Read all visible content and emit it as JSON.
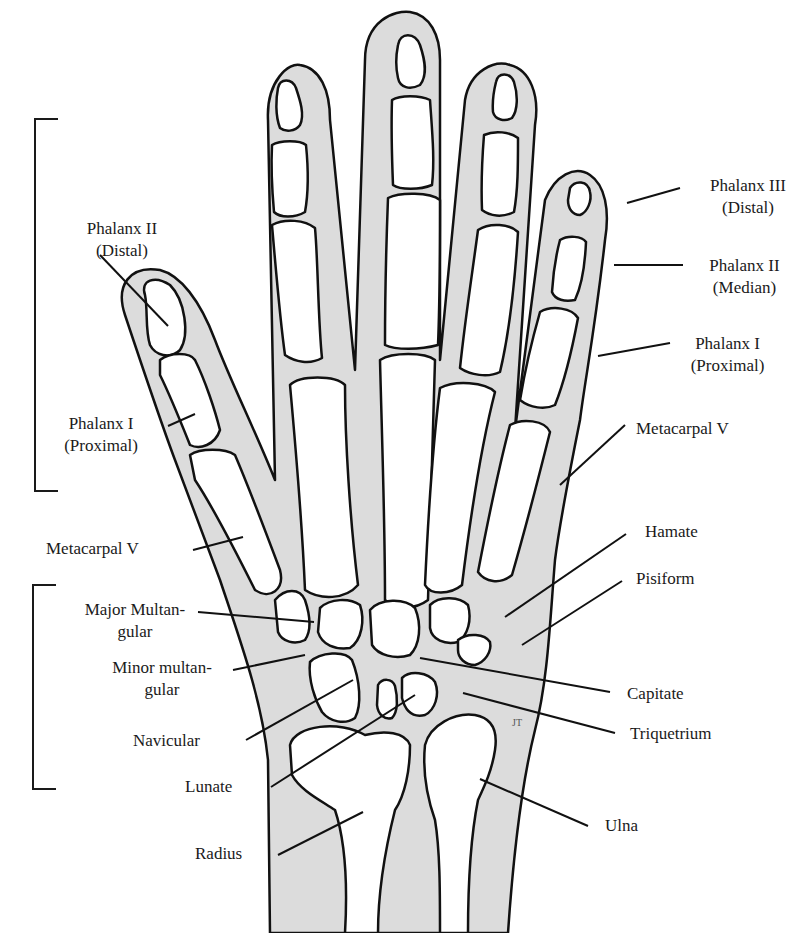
{
  "diagram": {
    "title": "",
    "colors": {
      "soft_tissue": "#dcdcdc",
      "bone": "#ffffff",
      "outline": "#111111",
      "text": "#1a1a1a"
    },
    "labels": {
      "left": {
        "phalanx_ii_distal": {
          "line1": "Phalanx II",
          "line2": "(Distal)"
        },
        "phalanx_i_proximal": {
          "line1": "Phalanx I",
          "line2": "(Proximal)"
        },
        "metacarpal_v": "Metacarpal V",
        "major_multangular": {
          "line1": "Major Multan-",
          "line2": "gular"
        },
        "minor_multangular": {
          "line1": "Minor multan-",
          "line2": "gular"
        },
        "navicular": "Navicular",
        "lunate": "Lunate",
        "radius": "Radius"
      },
      "right": {
        "phalanx_iii_distal": {
          "line1": "Phalanx III",
          "line2": "(Distal)"
        },
        "phalanx_ii_median": {
          "line1": "Phalanx II",
          "line2": "(Median)"
        },
        "phalanx_i_proximal": {
          "line1": "Phalanx I",
          "line2": "(Proximal)"
        },
        "metacarpal_v": "Metacarpal V",
        "hamate": "Hamate",
        "pisiform": "Pisiform",
        "capitate": "Capitate",
        "triquetrium": "Triquetrium",
        "ulna": "Ulna"
      }
    },
    "signature": "JT"
  }
}
